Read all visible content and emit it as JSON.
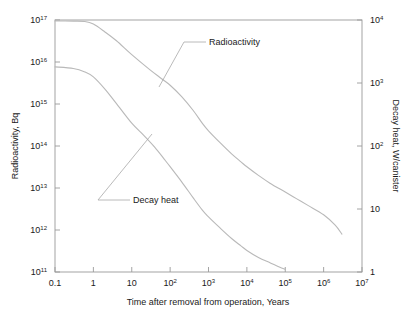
{
  "chart_data": {
    "type": "line",
    "title": "",
    "xlabel": "Time after removal from operation, Years",
    "ylabel": "Radioactivity, Bq",
    "y2label": "Decay heat, W/canister",
    "xlim": [
      0.1,
      10000000
    ],
    "ylim": [
      100000000000.0,
      1e+17
    ],
    "y2lim": [
      1,
      10000
    ],
    "xscale": "log",
    "yscale": "log",
    "grid": false,
    "legend_position": "inline-annotations",
    "xticks": [
      "0.1",
      "1",
      "10",
      "10²",
      "10³",
      "10⁴",
      "10⁵",
      "10⁶",
      "10⁷"
    ],
    "xtick_values": [
      0.1,
      1,
      10,
      100,
      1000,
      10000,
      100000,
      1000000,
      10000000
    ],
    "yticks": [
      "10¹¹",
      "10¹²",
      "10¹³",
      "10¹⁴",
      "10¹⁵",
      "10¹⁶",
      "10¹⁷"
    ],
    "ytick_values": [
      100000000000.0,
      1000000000000.0,
      10000000000000.0,
      100000000000000.0,
      1000000000000000.0,
      1e+16,
      1e+17
    ],
    "y2ticks": [
      "1",
      "10",
      "10²",
      "10³",
      "10⁴"
    ],
    "y2tick_values": [
      1,
      10,
      100,
      1000,
      10000
    ],
    "series": [
      {
        "name": "Radioactivity",
        "axis": "left",
        "unit": "Bq",
        "points": [
          [
            0.1,
            9.5e+16
          ],
          [
            0.3,
            9.4e+16
          ],
          [
            0.6,
            9.2e+16
          ],
          [
            1.0,
            8e+16
          ],
          [
            2.0,
            5.2e+16
          ],
          [
            4.0,
            3.2e+16
          ],
          [
            10,
            1.5e+16
          ],
          [
            30,
            6500000000000000.0
          ],
          [
            60,
            4000000000000000.0
          ],
          [
            100,
            2800000000000000.0
          ],
          [
            200,
            1500000000000000.0
          ],
          [
            400,
            700000000000000.0
          ],
          [
            700,
            340000000000000.0
          ],
          [
            1000,
            230000000000000.0
          ],
          [
            2000,
            120000000000000.0
          ],
          [
            4000,
            65000000000000.0
          ],
          [
            7000,
            42000000000000.0
          ],
          [
            10000,
            32000000000000.0
          ],
          [
            20000,
            20000000000000.0
          ],
          [
            40000,
            13000000000000.0
          ],
          [
            100000,
            8000000000000.0
          ],
          [
            200000,
            5500000000000.0
          ],
          [
            400000,
            3800000000000.0
          ],
          [
            1000000,
            2300000000000.0
          ],
          [
            2000000,
            1300000000000.0
          ],
          [
            3000000,
            800000000000.0
          ]
        ]
      },
      {
        "name": "Decay heat",
        "axis": "right",
        "unit": "W/canister",
        "points": [
          [
            0.1,
            1800
          ],
          [
            0.3,
            1700
          ],
          [
            0.6,
            1500
          ],
          [
            1.0,
            1250
          ],
          [
            2.0,
            800
          ],
          [
            4.0,
            470
          ],
          [
            10,
            230
          ],
          [
            20,
            150
          ],
          [
            40,
            95
          ],
          [
            70,
            62
          ],
          [
            100,
            47
          ],
          [
            200,
            27
          ],
          [
            400,
            15
          ],
          [
            700,
            9.5
          ],
          [
            1000,
            7.5
          ],
          [
            2000,
            5.0
          ],
          [
            4000,
            3.4
          ],
          [
            7000,
            2.6
          ],
          [
            10000,
            2.2
          ],
          [
            20000,
            1.7
          ],
          [
            40000,
            1.4
          ],
          [
            70000,
            1.2
          ],
          [
            100000,
            1.1
          ]
        ]
      }
    ],
    "annotations": [
      {
        "text": "Radioactivity",
        "label_x": 206,
        "label_y": 45,
        "target_x": 159,
        "target_y": 87
      },
      {
        "text": "Decay heat",
        "label_x": 130,
        "label_y": 203,
        "target_x": 152,
        "target_y": 134
      }
    ]
  },
  "axes": {
    "left_title": "Radioactivity, Bq",
    "right_title": "Decay heat, W/canister",
    "bottom_title": "Time after removal from operation, Years"
  }
}
